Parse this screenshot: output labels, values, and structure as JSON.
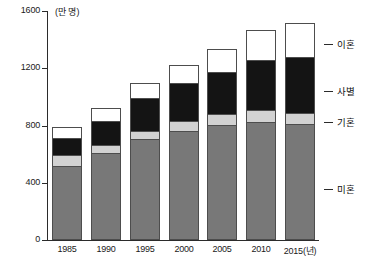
{
  "chart_data": {
    "type": "bar",
    "subtype": "stacked-vertical",
    "title": "",
    "subtitle": "",
    "xlabel": "",
    "ylabel": "",
    "unit_label": "(만 명)",
    "categories": [
      "1985",
      "1990",
      "1995",
      "2000",
      "2005",
      "2010",
      "2015(년)"
    ],
    "category_years": [
      1985,
      1990,
      1995,
      2000,
      2005,
      2010,
      2015
    ],
    "ylim": [
      0,
      1600
    ],
    "yticks": [
      0,
      400,
      800,
      1200,
      1600
    ],
    "ytick_labels": [
      "0",
      "400",
      "800",
      "1200",
      "1600"
    ],
    "grid": false,
    "legend_position": "right-outside",
    "series": [
      {
        "name": "미혼",
        "key": "single",
        "color": "#787878",
        "values": [
          515,
          600,
          700,
          755,
          795,
          820,
          805
        ]
      },
      {
        "name": "기혼",
        "key": "married",
        "color": "#d2d2d2",
        "values": [
          75,
          60,
          60,
          75,
          80,
          80,
          80
        ]
      },
      {
        "name": "사별",
        "key": "widowed",
        "color": "#141414",
        "values": [
          130,
          175,
          235,
          270,
          305,
          360,
          395
        ]
      },
      {
        "name": "이혼",
        "key": "divorced",
        "color": "#ffffff",
        "values": [
          70,
          85,
          105,
          125,
          155,
          210,
          235
        ]
      }
    ],
    "totals": [
      790,
      920,
      1100,
      1225,
      1335,
      1470,
      1515
    ],
    "cumulative_tops": {
      "single": [
        515,
        600,
        700,
        755,
        795,
        820,
        805
      ],
      "married": [
        590,
        660,
        760,
        830,
        875,
        900,
        885
      ],
      "widowed": [
        720,
        835,
        995,
        1100,
        1180,
        1260,
        1280
      ],
      "divorced": [
        790,
        920,
        1100,
        1225,
        1335,
        1470,
        1515
      ]
    }
  },
  "legend": {
    "entries": [
      {
        "label": "이혼",
        "key": "divorced"
      },
      {
        "label": "사별",
        "key": "widowed"
      },
      {
        "label": "기혼",
        "key": "married"
      },
      {
        "label": "미혼",
        "key": "single"
      }
    ]
  },
  "colors": {
    "single": "#787878",
    "married": "#d2d2d2",
    "widowed": "#141414",
    "divorced": "#ffffff",
    "axis": "#2b2b2b",
    "outline": "#4d4d4d",
    "text": "#1a1a1a",
    "background": "#ffffff"
  }
}
